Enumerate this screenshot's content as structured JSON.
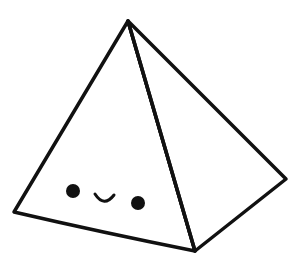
{
  "illustration": {
    "subject": "kawaii pyramid",
    "colors": {
      "background": "#ffffff",
      "stroke": "#111111",
      "fill": "#ffffff"
    },
    "vertices": {
      "apex": [
        128,
        21
      ],
      "left": [
        14,
        212
      ],
      "bottom": [
        195,
        251
      ],
      "right": [
        286,
        179
      ]
    },
    "face": {
      "left_eye": {
        "cx": 73,
        "cy": 191,
        "r": 7
      },
      "right_eye": {
        "cx": 138,
        "cy": 203,
        "r": 7
      },
      "smile": {
        "start": [
          95,
          194
        ],
        "end": [
          114,
          195
        ],
        "depth": 8
      }
    }
  }
}
